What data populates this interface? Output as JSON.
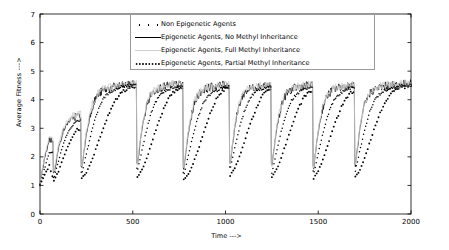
{
  "chart_data": {
    "type": "line",
    "title": "",
    "xlabel": "Time --->",
    "ylabel": "Average Fitness --->",
    "xlim": [
      0,
      2000
    ],
    "ylim": [
      0,
      7
    ],
    "xticks": [
      0,
      500,
      1000,
      1500,
      2000
    ],
    "yticks": [
      0,
      1,
      2,
      3,
      4,
      5,
      6,
      7
    ],
    "grid": false,
    "legend_position": "top-center",
    "series": [
      {
        "name": "Non Epigenetic Agents",
        "style": "sparse-dots",
        "color": "#000000",
        "description": "Slow recovering sawtooth, lags behind epigenetic series after each environmental change, reaches ~4.4 by t=2000",
        "x": [
          0,
          25,
          50,
          75,
          100,
          125,
          150,
          175,
          200,
          225,
          250,
          275,
          300,
          325,
          350,
          375,
          400,
          425,
          450,
          475,
          500,
          525,
          550,
          575,
          600,
          625,
          650,
          675,
          700,
          725,
          750,
          775,
          800,
          825,
          850,
          875,
          900,
          925,
          950,
          975,
          1000,
          1025,
          1050,
          1075,
          1100,
          1125,
          1150,
          1175,
          1200,
          1225,
          1250,
          1275,
          1300,
          1325,
          1350,
          1375,
          1400,
          1425,
          1450,
          1475,
          1500,
          1525,
          1550,
          1575,
          1600,
          1625,
          1650,
          1675,
          1700,
          1725,
          1750,
          1775,
          1800,
          1825,
          1850,
          1875,
          1900,
          1925,
          1950,
          1975,
          2000
        ],
        "y": [
          1.0,
          1.35,
          1.7,
          1.15,
          1.5,
          1.95,
          2.35,
          2.7,
          2.95,
          1.25,
          1.45,
          1.8,
          2.25,
          2.7,
          3.15,
          3.55,
          3.9,
          4.15,
          4.3,
          4.4,
          4.45,
          1.3,
          1.55,
          1.95,
          2.45,
          2.95,
          3.4,
          3.8,
          4.1,
          4.3,
          4.42,
          1.2,
          1.4,
          1.75,
          2.2,
          2.7,
          3.2,
          3.65,
          4.0,
          4.25,
          4.38,
          1.35,
          1.6,
          2.0,
          2.5,
          3.0,
          3.45,
          3.85,
          4.15,
          4.32,
          1.3,
          1.55,
          1.95,
          2.45,
          2.95,
          3.4,
          3.8,
          4.1,
          4.28,
          1.25,
          1.5,
          1.9,
          2.4,
          2.9,
          3.35,
          3.75,
          4.05,
          4.25,
          1.3,
          1.55,
          1.95,
          2.45,
          2.95,
          3.4,
          3.78,
          4.08,
          4.26,
          4.36,
          4.42,
          4.46,
          4.48
        ]
      },
      {
        "name": "Epigenetic Agents, No Methyl Inheritance",
        "style": "solid",
        "color": "#000000",
        "description": "Fast recovery with high-frequency oscillation, recovers within ~25 steps after each change",
        "x": [
          0,
          25,
          50,
          75,
          100,
          125,
          150,
          175,
          200,
          225,
          250,
          275,
          300,
          325,
          350,
          375,
          400,
          425,
          450,
          475,
          500,
          525,
          550,
          575,
          600,
          625,
          650,
          675,
          700,
          725,
          750,
          775,
          800,
          825,
          850,
          875,
          900,
          925,
          950,
          975,
          1000,
          1025,
          1050,
          1075,
          1100,
          1125,
          1150,
          1175,
          1200,
          1225,
          1250,
          1275,
          1300,
          1325,
          1350,
          1375,
          1400,
          1425,
          1450,
          1475,
          1500,
          1525,
          1550,
          1575,
          1600,
          1625,
          1650,
          1675,
          1700,
          1725,
          1750,
          1775,
          1800,
          1825,
          1850,
          1875,
          1900,
          1925,
          1950,
          1975,
          2000
        ],
        "y": [
          1.05,
          1.95,
          2.6,
          1.4,
          2.3,
          2.9,
          3.2,
          3.35,
          3.45,
          1.6,
          2.8,
          3.6,
          4.05,
          4.25,
          4.35,
          4.4,
          4.45,
          4.48,
          4.5,
          4.52,
          4.55,
          1.7,
          3.0,
          3.8,
          4.2,
          4.35,
          4.42,
          4.46,
          4.5,
          4.52,
          4.55,
          1.55,
          2.85,
          3.7,
          4.15,
          4.32,
          4.4,
          4.45,
          4.48,
          4.5,
          4.52,
          1.75,
          3.05,
          3.85,
          4.22,
          4.36,
          4.43,
          4.47,
          4.5,
          4.52,
          1.65,
          2.95,
          3.78,
          4.18,
          4.34,
          4.41,
          4.46,
          4.49,
          4.51,
          1.6,
          2.9,
          3.75,
          4.16,
          4.33,
          4.4,
          4.45,
          4.48,
          4.51,
          1.7,
          3.0,
          3.82,
          4.2,
          4.35,
          4.42,
          4.46,
          4.49,
          4.51,
          4.53,
          4.54,
          4.55,
          4.56
        ]
      },
      {
        "name": "Epigenetic Agents, Full Methyl Inheritance",
        "style": "light-solid",
        "color": "#cfcfcf",
        "description": "Very fast recovery, near-identical to no-methyl case but slightly smoother plateau tops",
        "x": [
          0,
          25,
          50,
          75,
          100,
          125,
          150,
          175,
          200,
          225,
          250,
          275,
          300,
          325,
          350,
          375,
          400,
          425,
          450,
          475,
          500,
          525,
          550,
          575,
          600,
          625,
          650,
          675,
          700,
          725,
          750,
          775,
          800,
          825,
          850,
          875,
          900,
          925,
          950,
          975,
          1000,
          1025,
          1050,
          1075,
          1100,
          1125,
          1150,
          1175,
          1200,
          1225,
          1250,
          1275,
          1300,
          1325,
          1350,
          1375,
          1400,
          1425,
          1450,
          1475,
          1500,
          1525,
          1550,
          1575,
          1600,
          1625,
          1650,
          1675,
          1700,
          1725,
          1750,
          1775,
          1800,
          1825,
          1850,
          1875,
          1900,
          1925,
          1950,
          1975,
          2000
        ],
        "y": [
          1.05,
          2.05,
          2.7,
          1.45,
          2.4,
          3.0,
          3.3,
          3.42,
          3.5,
          1.65,
          2.9,
          3.7,
          4.1,
          4.3,
          4.4,
          4.45,
          4.48,
          4.5,
          4.52,
          4.54,
          4.56,
          1.75,
          3.1,
          3.88,
          4.25,
          4.38,
          4.45,
          4.48,
          4.52,
          4.54,
          4.56,
          1.6,
          2.95,
          3.78,
          4.2,
          4.36,
          4.43,
          4.47,
          4.5,
          4.52,
          4.54,
          1.8,
          3.12,
          3.9,
          4.26,
          4.39,
          4.46,
          4.49,
          4.52,
          4.54,
          1.7,
          3.02,
          3.84,
          4.22,
          4.37,
          4.44,
          4.48,
          4.51,
          4.53,
          1.65,
          2.98,
          3.8,
          4.2,
          4.36,
          4.43,
          4.47,
          4.5,
          4.53,
          1.75,
          3.08,
          3.86,
          4.24,
          4.38,
          4.45,
          4.48,
          4.51,
          4.53,
          4.55,
          4.56,
          4.57,
          4.58
        ]
      },
      {
        "name": "Epigenetic Agents, Partial Methyl Inheritance",
        "style": "dotted",
        "color": "#000000",
        "description": "Intermediate recovery rate, dotted trace climbing steadily between drops",
        "x": [
          0,
          25,
          50,
          75,
          100,
          125,
          150,
          175,
          200,
          225,
          250,
          275,
          300,
          325,
          350,
          375,
          400,
          425,
          450,
          475,
          500,
          525,
          550,
          575,
          600,
          625,
          650,
          675,
          700,
          725,
          750,
          775,
          800,
          825,
          850,
          875,
          900,
          925,
          950,
          975,
          1000,
          1025,
          1050,
          1075,
          1100,
          1125,
          1150,
          1175,
          1200,
          1225,
          1250,
          1275,
          1300,
          1325,
          1350,
          1375,
          1400,
          1425,
          1450,
          1475,
          1500,
          1525,
          1550,
          1575,
          1600,
          1625,
          1650,
          1675,
          1700,
          1725,
          1750,
          1775,
          1800,
          1825,
          1850,
          1875,
          1900,
          1925,
          1950,
          1975,
          2000
        ],
        "y": [
          1.02,
          1.6,
          2.15,
          1.25,
          1.85,
          2.45,
          2.85,
          3.1,
          3.25,
          1.4,
          2.1,
          2.8,
          3.4,
          3.85,
          4.1,
          4.25,
          4.35,
          4.42,
          4.46,
          4.49,
          4.52,
          1.5,
          2.25,
          2.95,
          3.55,
          3.95,
          4.18,
          4.3,
          4.38,
          4.44,
          4.48,
          1.35,
          2.05,
          2.75,
          3.35,
          3.8,
          4.08,
          4.22,
          4.32,
          4.4,
          4.45,
          1.55,
          2.3,
          3.0,
          3.58,
          3.98,
          4.2,
          4.32,
          4.4,
          4.45,
          1.45,
          2.18,
          2.88,
          3.48,
          3.9,
          4.14,
          4.28,
          4.36,
          4.42,
          1.4,
          2.12,
          2.82,
          3.42,
          3.86,
          4.12,
          4.26,
          4.35,
          4.41,
          1.5,
          2.24,
          2.94,
          3.52,
          3.93,
          4.16,
          4.29,
          4.37,
          4.43,
          4.47,
          4.5,
          4.52,
          4.54
        ]
      }
    ]
  },
  "axes": {
    "ylabel": "Average Fitness --->",
    "xlabel": "Time --->",
    "xtick_labels": [
      "0",
      "500",
      "1000",
      "1500",
      "2000"
    ],
    "ytick_labels": [
      "0",
      "1",
      "2",
      "3",
      "4",
      "5",
      "6",
      "7"
    ]
  },
  "legend": {
    "items": [
      {
        "label": "Non Epigenetic Agents",
        "marker": "sparse-dots"
      },
      {
        "label": "Epigenetic Agents, No Methyl Inheritance",
        "marker": "solid-line"
      },
      {
        "label": "Epigenetic Agents, Full Methyl Inheritance",
        "marker": "light-line"
      },
      {
        "label": "Epigenetic Agents, Partial Methyl Inheritance",
        "marker": "dotted-line"
      }
    ]
  },
  "colors": {
    "axis": "#000000",
    "series_dark": "#000000",
    "series_light": "#cfcfcf",
    "background": "#ffffff",
    "legend_border": "#9a9a9a"
  }
}
